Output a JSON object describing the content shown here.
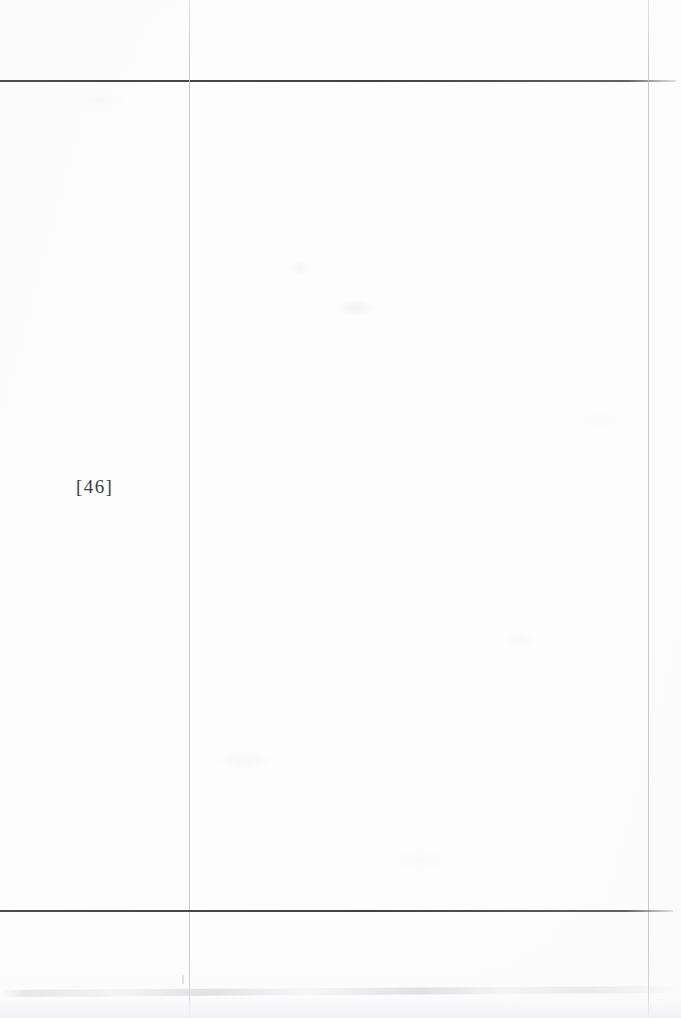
{
  "document": {
    "kind": "scanned-book-page",
    "background_color": "#fdfdfd",
    "page_width": 681,
    "page_height": 1018
  },
  "page_number": {
    "label": "[46]",
    "digits": "46",
    "bracket_open": "[",
    "bracket_close": "]",
    "color": "#3c3c44",
    "position": {
      "x": 78,
      "y": 481
    }
  },
  "rules": {
    "top_horizontal": {
      "name": "top-border-rule",
      "y": 81,
      "x_start": 0,
      "x_end": 676,
      "thickness": 2,
      "color": "#3c3c44"
    },
    "bottom_horizontal": {
      "name": "bottom-border-rule",
      "y": 911,
      "x_start": 0,
      "x_end": 673,
      "thickness": 2,
      "color": "#3c3c44"
    },
    "left_vertical": {
      "name": "left-margin-rule",
      "x": 189,
      "y_start": 0,
      "y_end": 1018,
      "thickness": 1,
      "color": "#c4c4cc"
    },
    "right_vertical": {
      "name": "right-margin-rule",
      "x": 648,
      "y_start": 0,
      "y_end": 1018,
      "thickness": 1,
      "color": "#c4c4cc"
    }
  },
  "artifacts": {
    "bottom_smudge": {
      "name": "scanner-edge-smudge",
      "y": 988,
      "color": "#d6d6dc"
    },
    "bottom_haze": {
      "name": "scanner-edge-haze",
      "y": 998,
      "color": "#eeeef2"
    },
    "left_tick": {
      "name": "scanner-tick-mark",
      "x": 182,
      "y": 975,
      "color": "#cfcfd6"
    }
  },
  "content": {
    "body_text": "",
    "note": "blank page"
  }
}
